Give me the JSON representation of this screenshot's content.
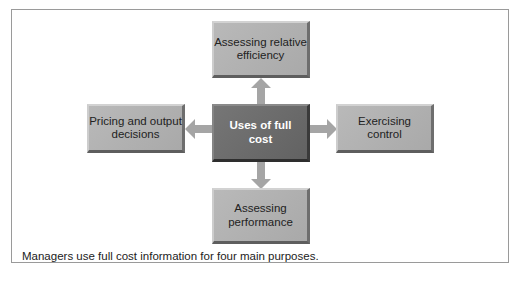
{
  "diagram": {
    "center": "Uses of full cost",
    "nodes": {
      "top": "Assessing relative efficiency",
      "left": "Pricing and output decisions",
      "right": "Exercising control",
      "bottom": "Assessing performance"
    },
    "caption": "Managers use full cost information for four main purposes."
  },
  "colors": {
    "outer_box": "#b0b0b0",
    "center_box": "#6b6b6b",
    "arrow": "#a5a5a5",
    "frame": "#9a9a9a"
  }
}
